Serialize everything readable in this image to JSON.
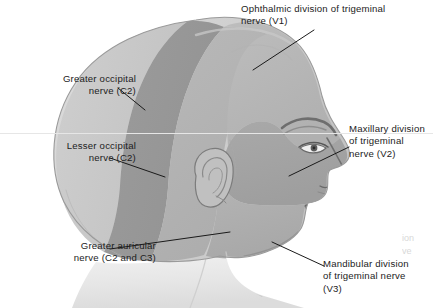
{
  "figure": {
    "view": "lateral right profile",
    "width": 433,
    "height": 308,
    "background_color": "#ffffff"
  },
  "palette": {
    "skin_base": "#d2d2d2",
    "skin_light": "#e2e2e2",
    "skin_highlight": "#efefef",
    "region_mid": "#b6b6b6",
    "region_dark": "#9d9d9d",
    "region_darker": "#8e8e8e",
    "outline": "#8a8a8a",
    "leader_line": "#1a1a1a",
    "text": "#1c1c1c",
    "bleed_text": "#d8d8d8"
  },
  "labels": [
    {
      "id": "ophthalmic-v1",
      "text": "Ophthalmic division of trigeminal\nnerve (V1)",
      "align": "left",
      "region": "forehead-and-scalp-anterior"
    },
    {
      "id": "greater-occipital-c2",
      "text": "Greater occipital\nnerve (C2)",
      "align": "right",
      "region": "posterior-scalp"
    },
    {
      "id": "lesser-occipital-c2",
      "text": "Lesser occipital\nnerve (C2)",
      "align": "right",
      "region": "post-auricular-scalp"
    },
    {
      "id": "greater-auricular-c2-c3",
      "text": "Greater auricular\nnerve (C2 and C3)",
      "align": "right",
      "region": "angle-of-jaw-and-ear"
    },
    {
      "id": "maxillary-v2",
      "text": "Maxillary division\nof trigeminal\nnerve (V2)",
      "align": "left",
      "region": "midface-cheek"
    },
    {
      "id": "mandibular-v3",
      "text": "Mandibular division\nof trigeminal nerve\n(V3)",
      "align": "left",
      "region": "lower-jaw"
    }
  ],
  "bleedthrough": {
    "text": "ion\nve"
  }
}
